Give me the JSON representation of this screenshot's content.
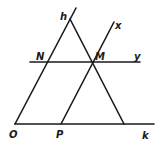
{
  "diagram": {
    "type": "geometry-construction",
    "labels": {
      "h": "h",
      "x": "x",
      "y": "y",
      "k": "k",
      "O": "O",
      "P": "P",
      "N": "N",
      "M": "M"
    },
    "points": [
      "O",
      "P",
      "N",
      "M"
    ],
    "rays": [
      "h",
      "k",
      "x",
      "y"
    ],
    "relations": [
      "ray h starts at O",
      "ray k starts at O",
      "line y passes through N on h and M",
      "line x passes through P on k and M",
      "y parallel to k",
      "x parallel to h"
    ],
    "colors": {
      "stroke": "#1a1a1a",
      "background": "#ffffff"
    }
  }
}
